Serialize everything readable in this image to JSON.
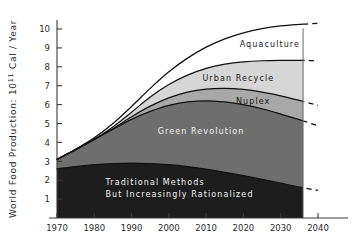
{
  "chart_data": {
    "type": "area",
    "title": "",
    "xlabel": "",
    "ylabel": "World Food Production: 10¹¹ Cal / Year",
    "xlim": [
      1970,
      2040
    ],
    "ylim": [
      0,
      10.6
    ],
    "grid": false,
    "legend": "inline-band-labels",
    "x_ticks": [
      "1970",
      "1980",
      "1990",
      "2000",
      "2010",
      "2020",
      "2030",
      "2040"
    ],
    "y_ticks": [
      "1",
      "2",
      "3",
      "4",
      "5",
      "6",
      "7",
      "8",
      "9",
      "10"
    ],
    "x": [
      1970,
      1975,
      1980,
      1985,
      1990,
      1995,
      2000,
      2005,
      2010,
      2015,
      2020,
      2025,
      2030,
      2035,
      2040
    ],
    "stack_order": [
      "Traditional Methods But Increasingly Rationalized",
      "Green Revolution",
      "Nuplex",
      "Urban Recycle",
      "Aquaculture"
    ],
    "series": [
      {
        "name": "Traditional Methods But Increasingly Rationalized",
        "cumulative": [
          2.6,
          2.72,
          2.82,
          2.88,
          2.9,
          2.88,
          2.82,
          2.72,
          2.58,
          2.42,
          2.24,
          2.04,
          1.84,
          1.64,
          1.46
        ],
        "fill": "#1d1d1d",
        "label": "Traditional Methods",
        "label2": "But Increasingly Rationalized",
        "label_color": "light"
      },
      {
        "name": "Green Revolution",
        "cumulative": [
          3.1,
          3.62,
          4.16,
          4.7,
          5.22,
          5.64,
          5.96,
          6.14,
          6.2,
          6.14,
          6.0,
          5.78,
          5.5,
          5.2,
          4.88
        ],
        "fill": "#6e6e6e",
        "label": "Green Revolution",
        "label_color": "light"
      },
      {
        "name": "Nuplex",
        "cumulative": [
          3.1,
          3.62,
          4.16,
          4.72,
          5.36,
          5.92,
          6.36,
          6.66,
          6.82,
          6.86,
          6.8,
          6.66,
          6.46,
          6.22,
          5.96
        ],
        "fill": "#a8a8a8",
        "label": "Nuplex",
        "label_color": "dark"
      },
      {
        "name": "Urban Recycle",
        "cumulative": [
          3.1,
          3.62,
          4.18,
          4.82,
          5.6,
          6.4,
          7.06,
          7.56,
          7.92,
          8.14,
          8.26,
          8.32,
          8.34,
          8.34,
          8.32
        ],
        "fill": "#d6d6d6",
        "label": "Urban Recycle",
        "label_color": "dark"
      },
      {
        "name": "Aquaculture",
        "cumulative": [
          3.1,
          3.64,
          4.24,
          5.0,
          5.9,
          6.86,
          7.74,
          8.46,
          9.04,
          9.48,
          9.8,
          10.02,
          10.16,
          10.24,
          10.3
        ],
        "fill": "#ffffff",
        "label": "Aquaculture",
        "label_color": "dark"
      }
    ],
    "dashed_extension_start_x": 2030,
    "plot_right_edge_x": 2036,
    "band_labels": [
      {
        "text": "Aquaculture",
        "x": 2019,
        "y": 9.05,
        "color": "dark"
      },
      {
        "text": "Urban Recycle",
        "x": 2009,
        "y": 7.25,
        "color": "dark"
      },
      {
        "text": "Nuplex",
        "x": 2018,
        "y": 6.05,
        "color": "dark"
      },
      {
        "text": "Green Revolution",
        "x": 1997,
        "y": 4.45,
        "color": "light"
      },
      {
        "text": "Traditional Methods",
        "x": 1983,
        "y": 1.75,
        "color": "light"
      },
      {
        "text": "But Increasingly Rationalized",
        "x": 1983,
        "y": 1.12,
        "color": "light"
      }
    ]
  }
}
